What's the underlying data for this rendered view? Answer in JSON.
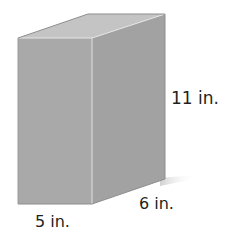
{
  "figure": {
    "type": "rectangular-prism",
    "dimensions": {
      "height": "11 in.",
      "depth": "6 in.",
      "width": "5 in."
    },
    "colors": {
      "front_face": "#a9a9a9",
      "side_face": "#a2a2a2",
      "top_face": "#c4c4c4",
      "edge_highlight": "#e6e6e6",
      "label_text": "#231f20"
    }
  }
}
